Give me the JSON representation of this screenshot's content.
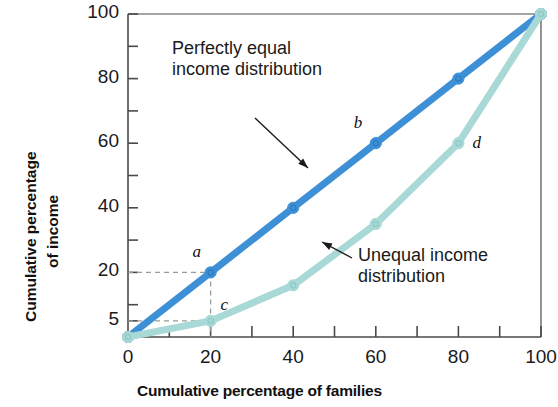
{
  "chart_data": {
    "type": "line",
    "title": "",
    "xlabel": "Cumulative percentage of families",
    "ylabel": "Cumulative percentage of income",
    "xlim": [
      0,
      100
    ],
    "ylim": [
      0,
      100
    ],
    "grid": false,
    "legend_position": "inline-annotations",
    "x_ticks_major": [
      0,
      20,
      40,
      60,
      80,
      100
    ],
    "x_tick_labels": [
      "0",
      "20",
      "40",
      "60",
      "80",
      "100"
    ],
    "x_ticks_minor": [
      10,
      30,
      50,
      70,
      90
    ],
    "y_ticks_major": [
      5,
      20,
      40,
      60,
      80,
      100
    ],
    "y_tick_labels": [
      "5",
      "20",
      "40",
      "60",
      "80",
      "100"
    ],
    "y_ticks_minor": [
      10,
      30,
      50,
      70,
      90
    ],
    "series": [
      {
        "name": "Perfectly equal income distribution",
        "color": "#3d8fd6",
        "x": [
          0,
          20,
          40,
          60,
          80,
          100
        ],
        "values": [
          0,
          20,
          40,
          60,
          80,
          100
        ],
        "markers": true
      },
      {
        "name": "Unequal income distribution",
        "color": "#a9d9d6",
        "x": [
          0,
          20,
          40,
          60,
          80,
          100
        ],
        "values": [
          0,
          5,
          16,
          35,
          60,
          100
        ],
        "markers": true
      }
    ],
    "point_labels": [
      {
        "id": "a",
        "text": "a",
        "x": 20,
        "y": 20,
        "series": "Perfectly equal income distribution"
      },
      {
        "id": "b",
        "text": "b",
        "x": 60,
        "y": 60,
        "series": "Perfectly equal income distribution"
      },
      {
        "id": "c",
        "text": "c",
        "x": 20,
        "y": 5,
        "series": "Unequal income distribution"
      },
      {
        "id": "d",
        "text": "d",
        "x": 80,
        "y": 60,
        "series": "Unequal income distribution"
      }
    ],
    "guide_lines": [
      {
        "type": "dashed",
        "from": [
          0,
          20
        ],
        "to": [
          20,
          20
        ]
      },
      {
        "type": "dashed",
        "from": [
          20,
          20
        ],
        "to": [
          20,
          0
        ]
      },
      {
        "type": "dashed",
        "from": [
          0,
          5
        ],
        "to": [
          20,
          5
        ]
      }
    ],
    "annotations": [
      {
        "id": "equal-annotation",
        "lines": [
          "Perfectly equal",
          "income distribution"
        ],
        "arrow_to": [
          38,
          44
        ]
      },
      {
        "id": "unequal-annotation",
        "lines": [
          "Unequal income",
          "distribution"
        ],
        "arrow_to": [
          50,
          25
        ]
      }
    ]
  },
  "axes": {
    "y_title_line1": "Cumulative percentage",
    "y_title_line2": "of income",
    "x_title": "Cumulative percentage of families"
  },
  "colors": {
    "equal_line": "#3d8fd6",
    "unequal_line": "#a9d9d6",
    "axis": "#4a4a4a",
    "text": "#1a1a1a",
    "guide": "#9a9a9a"
  }
}
